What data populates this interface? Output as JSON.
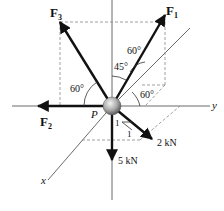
{
  "diagram": {
    "forces": [
      {
        "id": "F1",
        "label": "F",
        "sub": "1",
        "angles": [
          "60°",
          "45°",
          "60°"
        ]
      },
      {
        "id": "F2",
        "label": "F",
        "sub": "2"
      },
      {
        "id": "F3",
        "label": "F",
        "sub": "3",
        "angle": "60°"
      },
      {
        "id": "load_2kN",
        "label": "2 kN",
        "slope": [
          "1",
          "1"
        ]
      },
      {
        "id": "load_5kN",
        "label": "5 kN"
      }
    ],
    "point": "P",
    "axes": {
      "x": "x",
      "y": "y",
      "z": ""
    },
    "angle_labels": {
      "f1_z": "60°",
      "f1_45": "45°",
      "f1_y": "60°",
      "f3": "60°"
    },
    "slope_labels": {
      "a": "1",
      "b": "1"
    },
    "colors": {
      "line": "#111111",
      "axis": "#333333",
      "dashed": "#888888",
      "sphere_light": "#e8e8e8",
      "sphere_dark": "#6e6e6e"
    }
  }
}
